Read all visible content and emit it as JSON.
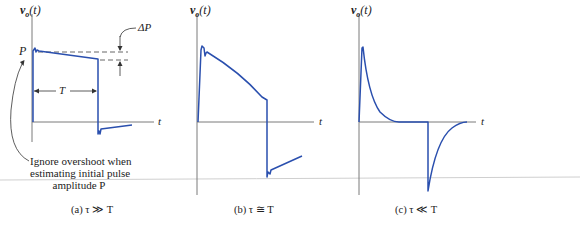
{
  "colors": {
    "signal": "#2a4fae",
    "axis": "#7a7a7a",
    "annotation": "#333333",
    "separator": "#c8c8c8"
  },
  "panels": [
    {
      "id": "a",
      "y_label": "v_o(t)",
      "y_label_main": "v",
      "y_label_sub": "o",
      "y_label_arg": "(t)",
      "x_label": "t",
      "caption": "(a) τ ≫ T",
      "annotations": {
        "amplitude": "P",
        "droop": "ΔP",
        "width": "T",
        "note_lines": [
          "Ignore overshoot when",
          "estimating initial pulse",
          "amplitude  P"
        ]
      },
      "description": "Nearly flat pulse with small droop ΔP over width T; small negative undershoot after trailing edge"
    },
    {
      "id": "b",
      "y_label": "v_o(t)",
      "y_label_main": "v",
      "y_label_sub": "o",
      "y_label_arg": "(t)",
      "x_label": "t",
      "caption": "(b) τ ≅ T",
      "description": "Pulse decays significantly over width; large negative swing after trailing edge recovering toward zero"
    },
    {
      "id": "c",
      "y_label": "v_o(t)",
      "y_label_main": "v",
      "y_label_sub": "o",
      "y_label_arg": "(t)",
      "x_label": "t",
      "caption": "(c) τ ≪ T",
      "description": "Positive spike decaying quickly to zero, then negative spike at trailing edge decaying back to zero"
    }
  ]
}
